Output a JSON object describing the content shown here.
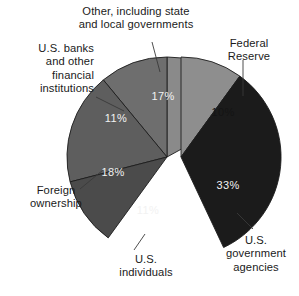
{
  "chart_data": {
    "type": "pie",
    "title": "",
    "subtitle": "",
    "xlabel": "",
    "ylabel": "",
    "legend_position": "none",
    "grid": false,
    "units": "percent",
    "total": 100,
    "exploded_group": [
      "Federal Reserve",
      "U.S. government agencies"
    ],
    "categories": [
      "Federal Reserve",
      "U.S. government agencies",
      "U.S. individuals",
      "Foreign ownership",
      "U.S. banks and other financial institutions",
      "Other, including state and local governments"
    ],
    "values": [
      10,
      33,
      11,
      18,
      11,
      17
    ],
    "slices": [
      {
        "label": "Federal Reserve",
        "value": 10,
        "value_label": "10%",
        "color": "#8e8e8e",
        "label_text_color": "#141414",
        "exploded": true
      },
      {
        "label": "U.S. government agencies",
        "value": 33,
        "value_label": "33%",
        "color": "#1b1b1b",
        "label_text_color": "#f2f2f2",
        "exploded": true
      },
      {
        "label": "U.S. individuals",
        "value": 11,
        "value_label": "11%",
        "color": "#4b4b4b",
        "label_text_color": "#f2f2f2",
        "exploded": false
      },
      {
        "label": "Foreign ownership",
        "value": 18,
        "value_label": "18%",
        "color": "#5e5e5e",
        "label_text_color": "#f2f2f2",
        "exploded": false
      },
      {
        "label": "U.S. banks and other financial institutions",
        "value": 11,
        "value_label": "11%",
        "color": "#6e6e6e",
        "label_text_color": "#f2f2f2",
        "exploded": false
      },
      {
        "label": "Other, including state and local governments",
        "value": 17,
        "value_label": "17%",
        "color": "#8a8a8a",
        "label_text_color": "#f2f2f2",
        "exploded": false
      }
    ]
  },
  "callouts": {
    "other": "Other, including state\nand local governments",
    "banks": "U.S. banks\nand other\nfinancial\ninstitutions",
    "federal_reserve": "Federal\nReserve",
    "foreign": "Foreign\nownership",
    "individuals": "U.S.\nindividuals",
    "agencies": "U.S.\ngovernment\nagencies"
  },
  "percent_labels": {
    "other": "17%",
    "banks": "11%",
    "foreign": "18%",
    "individuals": "11%",
    "federal_reserve": "10%",
    "agencies": "33%"
  },
  "colors": {
    "background": "#ffffff",
    "outline": "#1d1d1d",
    "leader_line": "#3a3a3a",
    "text": "#1a1a1a"
  }
}
